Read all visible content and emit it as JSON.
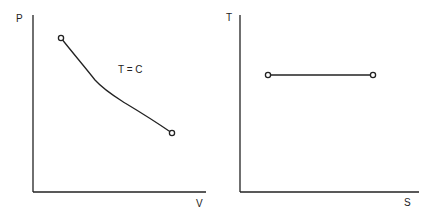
{
  "diagrams": [
    {
      "name": "P-V diagram",
      "y_axis_label": "P",
      "x_axis_label": "V",
      "curve_label": "T = C",
      "process": "isothermal",
      "curve_points": [
        [
          61,
          38
        ],
        [
          78,
          58
        ],
        [
          95,
          80
        ],
        [
          110,
          92
        ],
        [
          125,
          103
        ],
        [
          145,
          116
        ],
        [
          172,
          133
        ]
      ],
      "endpoints": [
        [
          61,
          38
        ],
        [
          172,
          133
        ]
      ]
    },
    {
      "name": "T-S diagram",
      "y_axis_label": "T",
      "x_axis_label": "S",
      "process": "isothermal",
      "curve_points": [
        [
          268,
          75
        ],
        [
          373,
          75
        ]
      ],
      "endpoints": [
        [
          268,
          75
        ],
        [
          373,
          75
        ]
      ]
    }
  ],
  "colors": {
    "line": "#222222",
    "background": "#ffffff"
  }
}
